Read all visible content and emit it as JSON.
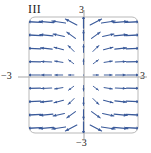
{
  "figure": {
    "panel_label": "III",
    "frame_color": "#b9b9b9",
    "axis_color": "#a8a8a8",
    "arrow_color": "#3a5a9a",
    "background": "#ffffff"
  },
  "axis_labels": {
    "top": "3",
    "bottom": "−3",
    "left": "−3",
    "right": "3"
  },
  "chart_data": {
    "type": "scatter",
    "title": "III",
    "subtitle": "",
    "xlabel": "",
    "ylabel": "",
    "xlim": [
      -3,
      3
    ],
    "ylim": [
      -3,
      3
    ],
    "grid": false,
    "legend": null,
    "annotations": [
      "III"
    ],
    "xticks": [
      -3,
      3
    ],
    "yticks": [
      -3,
      3
    ],
    "xticklabels": [
      "−3",
      "3"
    ],
    "yticklabels": [
      "−3",
      "3"
    ],
    "series": [
      {
        "name": "direction-field",
        "vectors": [
          {
            "x": -3,
            "y": 3,
            "u": -0.95,
            "v": 0.05
          },
          {
            "x": -2.25,
            "y": 3,
            "u": -0.96,
            "v": 0.08
          },
          {
            "x": -1.5,
            "y": 3,
            "u": -0.94,
            "v": 0.14
          },
          {
            "x": -0.75,
            "y": 3,
            "u": -0.78,
            "v": 0.4
          },
          {
            "x": 0,
            "y": 3,
            "u": 0.0,
            "v": 1.0
          },
          {
            "x": 0.75,
            "y": 3,
            "u": 0.78,
            "v": 0.4
          },
          {
            "x": 1.5,
            "y": 3,
            "u": 0.94,
            "v": 0.14
          },
          {
            "x": 2.25,
            "y": 3,
            "u": 0.96,
            "v": 0.08
          },
          {
            "x": 3,
            "y": 3,
            "u": 0.95,
            "v": 0.05
          },
          {
            "x": -3,
            "y": 2.25,
            "u": -0.97,
            "v": 0.05
          },
          {
            "x": -2.25,
            "y": 2.25,
            "u": -0.96,
            "v": 0.1
          },
          {
            "x": -1.5,
            "y": 2.25,
            "u": -0.92,
            "v": 0.2
          },
          {
            "x": -0.75,
            "y": 2.25,
            "u": -0.7,
            "v": 0.5
          },
          {
            "x": 0,
            "y": 2.25,
            "u": 0.0,
            "v": 1.0
          },
          {
            "x": 0.75,
            "y": 2.25,
            "u": 0.7,
            "v": 0.5
          },
          {
            "x": 1.5,
            "y": 2.25,
            "u": 0.92,
            "v": 0.2
          },
          {
            "x": 2.25,
            "y": 2.25,
            "u": 0.96,
            "v": 0.1
          },
          {
            "x": 3,
            "y": 2.25,
            "u": 0.97,
            "v": 0.05
          },
          {
            "x": -3,
            "y": 1.5,
            "u": -0.98,
            "v": 0.04
          },
          {
            "x": -2.25,
            "y": 1.5,
            "u": -0.97,
            "v": 0.1
          },
          {
            "x": -1.5,
            "y": 1.5,
            "u": -0.9,
            "v": 0.25
          },
          {
            "x": -0.75,
            "y": 1.5,
            "u": -0.6,
            "v": 0.6
          },
          {
            "x": 0,
            "y": 1.5,
            "u": 0.0,
            "v": 1.0
          },
          {
            "x": 0.75,
            "y": 1.5,
            "u": 0.6,
            "v": 0.6
          },
          {
            "x": 1.5,
            "y": 1.5,
            "u": 0.9,
            "v": 0.25
          },
          {
            "x": 2.25,
            "y": 1.5,
            "u": 0.97,
            "v": 0.1
          },
          {
            "x": 3,
            "y": 1.5,
            "u": 0.98,
            "v": 0.04
          },
          {
            "x": -3,
            "y": 0.75,
            "u": -0.99,
            "v": 0.02
          },
          {
            "x": -2.25,
            "y": 0.75,
            "u": -0.98,
            "v": 0.06
          },
          {
            "x": -1.5,
            "y": 0.75,
            "u": -0.94,
            "v": 0.15
          },
          {
            "x": -0.75,
            "y": 0.75,
            "u": -0.66,
            "v": 0.5
          },
          {
            "x": 0,
            "y": 0.75,
            "u": 0.0,
            "v": 1.0
          },
          {
            "x": 0.75,
            "y": 0.75,
            "u": 0.66,
            "v": 0.5
          },
          {
            "x": 1.5,
            "y": 0.75,
            "u": 0.94,
            "v": 0.15
          },
          {
            "x": 2.25,
            "y": 0.75,
            "u": 0.98,
            "v": 0.06
          },
          {
            "x": 3,
            "y": 0.75,
            "u": 0.99,
            "v": 0.02
          },
          {
            "x": -3,
            "y": 0,
            "u": -1.0,
            "v": 0.0
          },
          {
            "x": -2.25,
            "y": 0,
            "u": -1.0,
            "v": 0.0
          },
          {
            "x": -1.5,
            "y": 0,
            "u": -1.0,
            "v": 0.0
          },
          {
            "x": -0.75,
            "y": 0,
            "u": -1.0,
            "v": 0.0
          },
          {
            "x": 0,
            "y": 0,
            "u": 0.0,
            "v": 0.0
          },
          {
            "x": 0.75,
            "y": 0,
            "u": 1.0,
            "v": 0.0
          },
          {
            "x": 1.5,
            "y": 0,
            "u": 1.0,
            "v": 0.0
          },
          {
            "x": 2.25,
            "y": 0,
            "u": 1.0,
            "v": 0.0
          },
          {
            "x": 3,
            "y": 0,
            "u": 1.0,
            "v": 0.0
          },
          {
            "x": -3,
            "y": -0.75,
            "u": -0.99,
            "v": -0.02
          },
          {
            "x": -2.25,
            "y": -0.75,
            "u": -0.98,
            "v": -0.06
          },
          {
            "x": -1.5,
            "y": -0.75,
            "u": -0.94,
            "v": -0.15
          },
          {
            "x": -0.75,
            "y": -0.75,
            "u": -0.66,
            "v": -0.5
          },
          {
            "x": 0,
            "y": -0.75,
            "u": 0.0,
            "v": -1.0
          },
          {
            "x": 0.75,
            "y": -0.75,
            "u": 0.66,
            "v": -0.5
          },
          {
            "x": 1.5,
            "y": -0.75,
            "u": 0.94,
            "v": -0.15
          },
          {
            "x": 2.25,
            "y": -0.75,
            "u": 0.98,
            "v": -0.06
          },
          {
            "x": 3,
            "y": -0.75,
            "u": 0.99,
            "v": -0.02
          },
          {
            "x": -3,
            "y": -1.5,
            "u": -0.98,
            "v": -0.04
          },
          {
            "x": -2.25,
            "y": -1.5,
            "u": -0.97,
            "v": -0.1
          },
          {
            "x": -1.5,
            "y": -1.5,
            "u": -0.9,
            "v": -0.25
          },
          {
            "x": -0.75,
            "y": -1.5,
            "u": -0.6,
            "v": -0.6
          },
          {
            "x": 0,
            "y": -1.5,
            "u": 0.0,
            "v": -1.0
          },
          {
            "x": 0.75,
            "y": -1.5,
            "u": 0.6,
            "v": -0.6
          },
          {
            "x": 1.5,
            "y": -1.5,
            "u": 0.9,
            "v": -0.25
          },
          {
            "x": 2.25,
            "y": -1.5,
            "u": 0.97,
            "v": -0.1
          },
          {
            "x": 3,
            "y": -1.5,
            "u": 0.98,
            "v": -0.04
          },
          {
            "x": -3,
            "y": -2.25,
            "u": -0.97,
            "v": -0.05
          },
          {
            "x": -2.25,
            "y": -2.25,
            "u": -0.96,
            "v": -0.1
          },
          {
            "x": -1.5,
            "y": -2.25,
            "u": -0.92,
            "v": -0.2
          },
          {
            "x": -0.75,
            "y": -2.25,
            "u": -0.7,
            "v": -0.5
          },
          {
            "x": 0,
            "y": -2.25,
            "u": 0.0,
            "v": -1.0
          },
          {
            "x": 0.75,
            "y": -2.25,
            "u": 0.7,
            "v": -0.5
          },
          {
            "x": 1.5,
            "y": -2.25,
            "u": 0.92,
            "v": -0.2
          },
          {
            "x": 2.25,
            "y": -2.25,
            "u": 0.96,
            "v": -0.1
          },
          {
            "x": 3,
            "y": -2.25,
            "u": 0.97,
            "v": -0.05
          },
          {
            "x": -3,
            "y": -3,
            "u": -0.95,
            "v": -0.05
          },
          {
            "x": -2.25,
            "y": -3,
            "u": -0.96,
            "v": -0.08
          },
          {
            "x": -1.5,
            "y": -3,
            "u": -0.94,
            "v": -0.14
          },
          {
            "x": -0.75,
            "y": -3,
            "u": -0.78,
            "v": -0.4
          },
          {
            "x": 0,
            "y": -3,
            "u": 0.0,
            "v": -1.0
          },
          {
            "x": 0.75,
            "y": -3,
            "u": 0.78,
            "v": -0.4
          },
          {
            "x": 1.5,
            "y": -3,
            "u": 0.94,
            "v": -0.14
          },
          {
            "x": 2.25,
            "y": -3,
            "u": 0.96,
            "v": -0.08
          },
          {
            "x": 3,
            "y": -3,
            "u": 0.95,
            "v": -0.05
          }
        ]
      }
    ]
  }
}
